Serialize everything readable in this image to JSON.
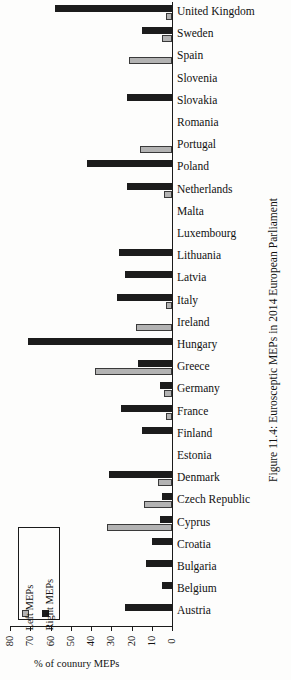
{
  "figure": {
    "caption": "Figure 11.4: Eurosceptic MEPs in 2014 European Parliament"
  },
  "axis": {
    "value_axis_title": "% of counury MEPs",
    "tick_labels": [
      "80",
      "70",
      "60",
      "50",
      "40",
      "30",
      "20",
      "10",
      "0"
    ]
  },
  "legend": {
    "entries": [
      {
        "label": "Left MEPs",
        "swatch": "gray-square-swatch",
        "color": "#b3b3b3"
      },
      {
        "label": "Right MEPs",
        "swatch": "black-square-swatch",
        "color": "#1c1c1c"
      }
    ]
  },
  "chart_data": {
    "type": "bar",
    "title": "Figure 11.4: Eurosceptic MEPs in 2014 European Parliament",
    "xlabel": "",
    "ylabel": "% of counury MEPs",
    "ylim": [
      0,
      80
    ],
    "orientation": "horizontal",
    "grid": false,
    "legend_position": "bottom-left",
    "categories": [
      "United Kingdom",
      "Sweden",
      "Spain",
      "Slovenia",
      "Slovakia",
      "Romania",
      "Portugal",
      "Poland",
      "Netherlands",
      "Malta",
      "Luxembourg",
      "Lithuania",
      "Latvia",
      "Italy",
      "Ireland",
      "Hungary",
      "Greece",
      "Germany",
      "France",
      "Finland",
      "Estonia",
      "Denmark",
      "Czech Republic",
      "Cyprus",
      "Croatia",
      "Bulgaria",
      "Belgium",
      "Austria"
    ],
    "series": [
      {
        "name": "Left MEPs",
        "color": "#b3b3b3",
        "values": [
          3,
          5,
          21,
          0,
          0,
          0,
          16,
          0,
          4,
          0,
          0,
          0,
          0,
          3,
          18,
          0,
          38,
          4,
          3,
          0,
          0,
          7,
          14,
          32,
          0,
          0,
          0,
          0
        ]
      },
      {
        "name": "Right MEPs",
        "color": "#1c1c1c",
        "values": [
          58,
          15,
          0,
          0,
          22,
          0,
          0,
          42,
          22,
          0,
          0,
          26,
          23,
          27,
          0,
          71,
          17,
          6,
          25,
          15,
          0,
          31,
          5,
          6,
          10,
          13,
          5,
          23
        ]
      }
    ]
  }
}
